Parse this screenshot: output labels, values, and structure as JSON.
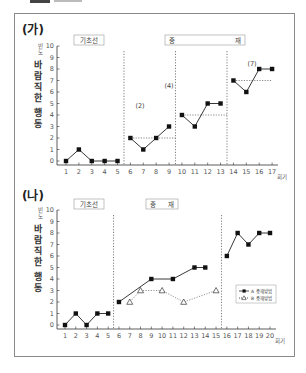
{
  "page": {
    "top_cutoff_text": "",
    "panels": [
      {
        "id": "ga",
        "label": "(가)"
      },
      {
        "id": "na",
        "label": "(나)"
      }
    ]
  },
  "chart_data": [
    {
      "type": "line",
      "title": "(가)",
      "ylabel": "바람직한 행동",
      "ylabel_unit": "빈도",
      "xlabel": "회기",
      "ylim": [
        0,
        10
      ],
      "yticks": [
        0,
        1,
        2,
        3,
        4,
        5,
        6,
        7,
        8,
        9,
        10
      ],
      "xticks": [
        1,
        2,
        3,
        4,
        5,
        6,
        7,
        8,
        9,
        10,
        11,
        12,
        13,
        14,
        15,
        16,
        17
      ],
      "phases": [
        {
          "label": "기초선",
          "start": 1,
          "end": 5
        },
        {
          "label": "중 재",
          "start": 6,
          "end": 17
        }
      ],
      "phase_dividers": [
        5.5,
        9.5,
        13.5
      ],
      "series": [
        {
          "name": "바람직한 행동",
          "marker": "square-filled",
          "segments": [
            {
              "x": [
                1,
                2,
                3,
                4,
                5
              ],
              "y": [
                0,
                1,
                0,
                0,
                0
              ]
            },
            {
              "x": [
                6,
                7,
                8,
                9
              ],
              "y": [
                2,
                1,
                2,
                3
              ]
            },
            {
              "x": [
                10,
                11,
                12,
                13
              ],
              "y": [
                4,
                3,
                5,
                5
              ]
            },
            {
              "x": [
                14,
                15,
                16,
                17
              ],
              "y": [
                7,
                6,
                8,
                8
              ]
            }
          ]
        }
      ],
      "criterion_lines": [
        {
          "label": "(2)",
          "value": 2,
          "from": 6,
          "to": 9.5
        },
        {
          "label": "(4)",
          "value": 4,
          "from": 10,
          "to": 13.5
        },
        {
          "label": "(7)",
          "value": 7,
          "from": 14,
          "to": 17
        }
      ],
      "grid": false
    },
    {
      "type": "line",
      "title": "(나)",
      "ylabel": "바람직한 행동",
      "ylabel_unit": "빈도",
      "xlabel": "회기",
      "ylim": [
        0,
        10
      ],
      "yticks": [
        0,
        1,
        2,
        3,
        4,
        5,
        6,
        7,
        8,
        9,
        10
      ],
      "xticks": [
        1,
        2,
        3,
        4,
        5,
        6,
        7,
        8,
        9,
        10,
        11,
        12,
        13,
        14,
        15,
        16,
        17,
        18,
        19,
        20
      ],
      "phases": [
        {
          "label": "기초선",
          "start": 1,
          "end": 5
        },
        {
          "label": "중 재",
          "start": 6,
          "end": 15
        }
      ],
      "phase_dividers": [
        5.5,
        15.5
      ],
      "series": [
        {
          "name": "A 중재방법",
          "marker": "square-filled",
          "line": "solid",
          "segments": [
            {
              "x": [
                1,
                2,
                3,
                4,
                5
              ],
              "y": [
                0,
                1,
                0,
                1,
                1
              ]
            },
            {
              "x": [
                6,
                9,
                11,
                13,
                14
              ],
              "y": [
                2,
                4,
                4,
                5,
                5
              ]
            },
            {
              "x": [
                16,
                17,
                18,
                19,
                20
              ],
              "y": [
                6,
                8,
                7,
                8,
                8
              ]
            }
          ]
        },
        {
          "name": "B 중재방법",
          "marker": "triangle-open",
          "line": "dotted",
          "segments": [
            {
              "x": [
                7,
                8,
                10,
                12,
                15
              ],
              "y": [
                2,
                3,
                3,
                2,
                3
              ]
            }
          ]
        }
      ],
      "legend": {
        "position": "right-middle",
        "entries": [
          "A 중재방법",
          "B 중재방법"
        ]
      },
      "grid": false
    }
  ]
}
